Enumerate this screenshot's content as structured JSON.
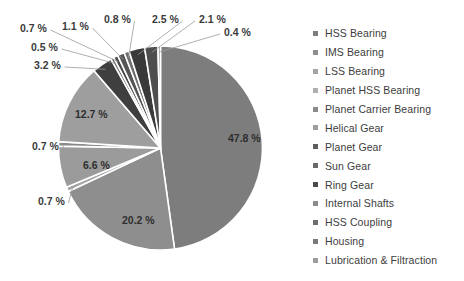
{
  "chart_data": {
    "type": "pie",
    "title": "",
    "subtitle": "",
    "xlabel": "",
    "ylabel": "",
    "legend_position": "right",
    "grid": false,
    "units": "%",
    "value_label_suffix": " %",
    "start_angle_deg": 0,
    "direction": "clockwise",
    "categories": [
      "HSS Bearing",
      "IMS Bearing",
      "LSS Bearing",
      "Planet HSS Bearing",
      "Planet Carrier Bearing",
      "Helical Gear",
      "Planet Gear",
      "Sun Gear",
      "Ring Gear",
      "Internal Shafts",
      "HSS Coupling",
      "Housing",
      "Lubrication & Filtraction"
    ],
    "values": [
      47.8,
      20.2,
      0.7,
      6.6,
      0.7,
      12.7,
      3.2,
      0.5,
      0.7,
      1.1,
      0.8,
      2.5,
      2.1
    ],
    "value_labels": [
      "47.8 %",
      "20.2 %",
      "0.7 %",
      "6.6 %",
      "0.7 %",
      "12.7 %",
      "3.2 %",
      "0.5 %",
      "0.7 %",
      "1.1 %",
      "0.8 %",
      "2.5 %",
      "2.1 %"
    ],
    "extra_labels": [
      "0.4 %"
    ],
    "colors": [
      "#7d7d7d",
      "#8e8e8e",
      "#a4a4a4",
      "#9b9b9b",
      "#8a8a8a",
      "#9e9e9e",
      "#3f3f3f",
      "#6a6a6a",
      "#4a4a4a",
      "#555555",
      "#6f6f6f",
      "#3a3a3a",
      "#4e4e4e"
    ]
  },
  "legend": {
    "items": [
      {
        "label": "HSS Bearing",
        "color": "#7d7d7d"
      },
      {
        "label": "IMS Bearing",
        "color": "#8e8e8e"
      },
      {
        "label": "LSS Bearing",
        "color": "#a4a4a4"
      },
      {
        "label": "Planet HSS Bearing",
        "color": "#b0b0b0"
      },
      {
        "label": "Planet Carrier Bearing",
        "color": "#8a8a8a"
      },
      {
        "label": "Helical Gear",
        "color": "#9e9e9e"
      },
      {
        "label": "Planet Gear",
        "color": "#5e5e5e"
      },
      {
        "label": "Sun Gear",
        "color": "#6a6a6a"
      },
      {
        "label": "Ring Gear",
        "color": "#4a4a4a"
      },
      {
        "label": "Internal Shafts",
        "color": "#8b8b8b"
      },
      {
        "label": "HSS Coupling",
        "color": "#6f6f6f"
      },
      {
        "label": "Housing",
        "color": "#7a7a7a"
      },
      {
        "label": "Lubrication & Filtraction",
        "color": "#9c9c9c"
      }
    ]
  },
  "pie_slices": [
    {
      "name": "HSS Bearing",
      "label": "47.8 %",
      "value": 47.8,
      "color": "#7d7d7d",
      "label_mode": "inside",
      "label_x": 228,
      "label_y": 139
    },
    {
      "name": "IMS Bearing",
      "label": "20.2 %",
      "value": 20.2,
      "color": "#8e8e8e",
      "label_mode": "inside",
      "label_x": 122,
      "label_y": 221
    },
    {
      "name": "LSS Bearing",
      "label": "0.7 %",
      "value": 0.7,
      "color": "#a4a4a4",
      "label_mode": "outside",
      "label_x": 38,
      "label_y": 202
    },
    {
      "name": "Planet HSS Bearing",
      "label": "6.6 %",
      "value": 6.6,
      "color": "#9b9b9b",
      "label_mode": "inside",
      "label_x": 83,
      "label_y": 166
    },
    {
      "name": "Planet Carrier Bearing",
      "label": "0.7 %",
      "value": 0.7,
      "color": "#8a8a8a",
      "label_mode": "outside",
      "label_x": 32,
      "label_y": 147
    },
    {
      "name": "Helical Gear",
      "label": "12.7 %",
      "value": 12.7,
      "color": "#9e9e9e",
      "label_mode": "inside",
      "label_x": 75,
      "label_y": 115
    },
    {
      "name": "Planet Gear",
      "label": "3.2 %",
      "value": 3.2,
      "color": "#3f3f3f",
      "label_mode": "outside",
      "label_x": 34,
      "label_y": 66
    },
    {
      "name": "Sun Gear",
      "label": "0.5 %",
      "value": 0.5,
      "color": "#6a6a6a",
      "label_mode": "outside",
      "label_x": 31,
      "label_y": 48
    },
    {
      "name": "Ring Gear",
      "label": "0.7 %",
      "value": 0.7,
      "color": "#4a4a4a",
      "label_mode": "outside",
      "label_x": 20,
      "label_y": 29
    },
    {
      "name": "Internal Shafts",
      "label": "1.1 %",
      "value": 1.1,
      "color": "#555555",
      "label_mode": "outside",
      "label_x": 62,
      "label_y": 27
    },
    {
      "name": "HSS Coupling",
      "label": "0.8 %",
      "value": 0.8,
      "color": "#6f6f6f",
      "label_mode": "outside",
      "label_x": 104,
      "label_y": 20
    },
    {
      "name": "Housing",
      "label": "2.5 %",
      "value": 2.5,
      "color": "#3a3a3a",
      "label_mode": "outside",
      "label_x": 152,
      "label_y": 20
    },
    {
      "name": "Lubrication & Filtraction",
      "label": "2.1 %",
      "value": 2.1,
      "color": "#4e4e4e",
      "label_mode": "outside",
      "label_x": 199,
      "label_y": 20
    }
  ],
  "extra_slice_label": {
    "label": "0.4 %",
    "label_x": 224,
    "label_y": 33
  }
}
